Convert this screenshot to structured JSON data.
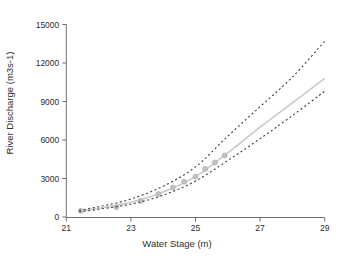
{
  "figure": {
    "background": "#ffffff",
    "axis_color": "#6e6e6e",
    "text_color": "#2e2e2e"
  },
  "chart_data": {
    "type": "line",
    "title": "",
    "xlabel": "Water Stage (m)",
    "ylabel": "River Discharge (m3s-1)",
    "xlim": [
      21,
      29
    ],
    "ylim": [
      0,
      15000
    ],
    "xticks": [
      21,
      23,
      25,
      27,
      29
    ],
    "yticks": [
      0,
      3000,
      6000,
      9000,
      12000,
      15000
    ],
    "grid": false,
    "legend_position": "none",
    "series": [
      {
        "name": "rating-curve",
        "style": "solid",
        "color": "#c9c9c9",
        "width": 1.6,
        "x": [
          21.4,
          22,
          23,
          24,
          25,
          26,
          27,
          28,
          29
        ],
        "y": [
          450,
          680,
          1150,
          1950,
          3150,
          5000,
          7000,
          8900,
          10800
        ]
      },
      {
        "name": "upper-confidence-limit",
        "style": "dashed",
        "color": "#3c3c3c",
        "width": 1.1,
        "x": [
          21.4,
          22,
          23,
          24,
          25,
          26,
          27,
          28,
          29
        ],
        "y": [
          520,
          800,
          1400,
          2400,
          3900,
          6300,
          8600,
          10900,
          13700
        ]
      },
      {
        "name": "lower-confidence-limit",
        "style": "dashed",
        "color": "#3c3c3c",
        "width": 1.1,
        "x": [
          21.4,
          22,
          23,
          24,
          25,
          26,
          27,
          28,
          29
        ],
        "y": [
          410,
          600,
          1000,
          1700,
          2800,
          4400,
          6100,
          7900,
          9800
        ]
      },
      {
        "name": "observations",
        "style": "points",
        "color": "#c2c2c2",
        "edge_color": "#a8a8a8",
        "marker_radius": 2.5,
        "x": [
          21.45,
          22.55,
          23.3,
          23.85,
          24.3,
          24.65,
          25.0,
          25.3,
          25.6,
          25.9
        ],
        "y": [
          480,
          760,
          1250,
          1800,
          2300,
          2750,
          3150,
          3750,
          4250,
          4800
        ]
      }
    ]
  }
}
